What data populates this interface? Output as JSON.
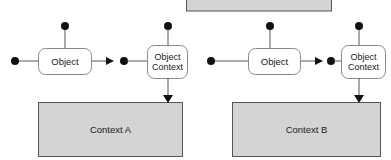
{
  "diagram": {
    "colors": {
      "context_fill": "#d4d4d4",
      "context_stroke": "#555555",
      "node_fill": "#ffffff",
      "node_stroke": "#8a8a8a",
      "connector": "#555555",
      "dot": "#111111",
      "background": "#ffffff"
    },
    "partial_box": {
      "label": "",
      "note": "gray context box cropped at top edge"
    },
    "groups": [
      {
        "id": "group-a",
        "object_label": "Object",
        "object_context_label_line1": "Object",
        "object_context_label_line2": "Context",
        "context_label": "Context A"
      },
      {
        "id": "group-b",
        "object_label": "Object",
        "object_context_label_line1": "Object",
        "object_context_label_line2": "Context",
        "context_label": "Context B"
      }
    ]
  }
}
